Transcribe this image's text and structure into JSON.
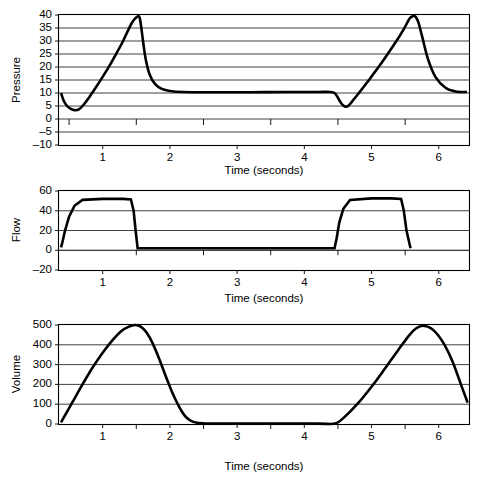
{
  "figure": {
    "title": "",
    "background": "#ffffff",
    "trace_color": "#000000",
    "grid_color": "#2b2b2b"
  },
  "chart_data": [
    {
      "type": "line",
      "panel": "pressure",
      "title": "",
      "xlabel": "Time (seconds)",
      "ylabel": "Pressure",
      "xlim": [
        0.35,
        6.45
      ],
      "ylim": [
        -10,
        40
      ],
      "xticks": [
        1,
        2,
        3,
        4,
        5,
        6
      ],
      "xtick_labels": [
        "1",
        "2",
        "3",
        "4",
        "5",
        "6"
      ],
      "minor_xticks": [
        0.5,
        1.5,
        2.5,
        3.5,
        4.5,
        5.5
      ],
      "yticks": [
        -10,
        -5,
        0,
        5,
        10,
        15,
        20,
        25,
        30,
        35,
        40
      ],
      "ytick_labels": [
        "–10",
        "–5",
        "0",
        "5",
        "10",
        "15",
        "20",
        "25",
        "30",
        "35",
        "40"
      ],
      "grid": true,
      "legend": null,
      "series": [
        {
          "name": "Airway pressure",
          "x": [
            0.38,
            0.42,
            0.47,
            0.52,
            0.58,
            0.64,
            0.7,
            0.8,
            0.9,
            1.0,
            1.1,
            1.2,
            1.3,
            1.38,
            1.44,
            1.48,
            1.51,
            1.53,
            1.55,
            1.57,
            1.6,
            1.64,
            1.7,
            1.78,
            1.88,
            2.0,
            2.2,
            2.6,
            3.2,
            3.8,
            4.2,
            4.38,
            4.45,
            4.5,
            4.54,
            4.58,
            4.62,
            4.66,
            4.7,
            4.8,
            4.95,
            5.15,
            5.35,
            5.48,
            5.56,
            5.6,
            5.63,
            5.66,
            5.7,
            5.76,
            5.84,
            5.95,
            6.1,
            6.25,
            6.42
          ],
          "y": [
            10.0,
            7.0,
            5.0,
            4.0,
            3.4,
            3.6,
            5.0,
            8.4,
            12.2,
            16.2,
            20.4,
            25.0,
            29.8,
            34.2,
            37.2,
            38.6,
            39.3,
            39.5,
            39.0,
            36.0,
            30.0,
            23.0,
            17.0,
            13.4,
            11.6,
            10.8,
            10.4,
            10.3,
            10.3,
            10.4,
            10.4,
            10.4,
            10.0,
            8.2,
            6.4,
            5.2,
            4.7,
            5.2,
            6.4,
            9.6,
            14.6,
            21.6,
            29.2,
            34.6,
            38.4,
            39.4,
            39.6,
            39.2,
            37.0,
            31.0,
            23.0,
            16.2,
            12.0,
            10.6,
            10.4
          ]
        }
      ]
    },
    {
      "type": "line",
      "panel": "flow",
      "title": "",
      "xlabel": "Time (seconds)",
      "ylabel": "Flow",
      "xlim": [
        0.35,
        6.45
      ],
      "ylim": [
        -20,
        60
      ],
      "xticks": [
        1,
        2,
        3,
        4,
        5,
        6
      ],
      "xtick_labels": [
        "1",
        "2",
        "3",
        "4",
        "5",
        "6"
      ],
      "minor_xticks": [
        1.5,
        2.5,
        3.5,
        4.5,
        5.5
      ],
      "yticks": [
        -20,
        0,
        20,
        40,
        60
      ],
      "ytick_labels": [
        "–20",
        "0",
        "20",
        "40",
        "60"
      ],
      "grid": true,
      "legend": null,
      "series": [
        {
          "name": "Inspiratory flow",
          "x": [
            0.38,
            0.4,
            0.44,
            0.5,
            0.58,
            0.7,
            1.0,
            1.3,
            1.42,
            1.46,
            1.49,
            1.52,
            4.45,
            4.48,
            4.52,
            4.58,
            4.68,
            5.0,
            5.3,
            5.44,
            5.48,
            5.52,
            5.58
          ],
          "y": [
            3.0,
            8.0,
            20.0,
            34.0,
            45.0,
            51.0,
            52.0,
            52.0,
            51.5,
            40.0,
            20.0,
            2.0,
            2.0,
            12.0,
            28.0,
            42.0,
            51.0,
            52.5,
            52.5,
            52.0,
            40.0,
            20.0,
            2.0
          ]
        }
      ]
    },
    {
      "type": "line",
      "panel": "volume",
      "title": "",
      "xlabel": "Time (seconds)",
      "ylabel": "Volume",
      "xlim": [
        0.35,
        6.45
      ],
      "ylim": [
        0,
        500
      ],
      "xticks": [
        1,
        2,
        3,
        4,
        5,
        6
      ],
      "xtick_labels": [
        "1",
        "2",
        "3",
        "4",
        "5",
        "6"
      ],
      "minor_xticks": [
        1.5,
        2.5,
        3.5,
        4.5,
        5.5
      ],
      "yticks": [
        0,
        100,
        200,
        300,
        400,
        500
      ],
      "ytick_labels": [
        "0",
        "100",
        "200",
        "300",
        "400",
        "500"
      ],
      "grid": true,
      "legend": null,
      "series": [
        {
          "name": "Tidal volume",
          "x": [
            0.38,
            0.45,
            0.55,
            0.7,
            0.85,
            1.0,
            1.15,
            1.28,
            1.4,
            1.48,
            1.54,
            1.6,
            1.66,
            1.74,
            1.84,
            1.94,
            2.04,
            2.14,
            2.22,
            2.3,
            2.4,
            2.6,
            3.0,
            3.6,
            4.2,
            4.46,
            4.6,
            4.8,
            5.0,
            5.2,
            5.4,
            5.56,
            5.66,
            5.76,
            5.9,
            6.05,
            6.2,
            6.34,
            6.43
          ],
          "y": [
            8.0,
            50.0,
            110.0,
            200.0,
            285.0,
            360.0,
            425.0,
            470.0,
            493.0,
            500.0,
            496.0,
            482.0,
            458.0,
            410.0,
            330.0,
            240.0,
            155.0,
            85.0,
            42.0,
            18.0,
            6.0,
            2.0,
            2.0,
            2.0,
            2.0,
            2.0,
            36.0,
            105.0,
            188.0,
            280.0,
            375.0,
            448.0,
            482.0,
            496.0,
            480.0,
            420.0,
            320.0,
            190.0,
            108.0
          ]
        }
      ]
    }
  ]
}
